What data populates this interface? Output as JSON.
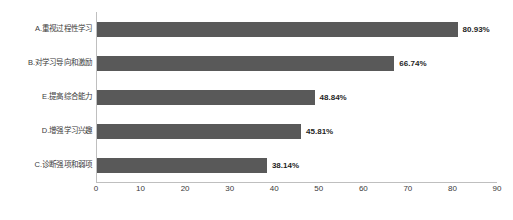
{
  "chart_data": {
    "type": "bar",
    "orientation": "horizontal",
    "title": "",
    "xlabel": "",
    "ylabel": "",
    "xlim": [
      0,
      90
    ],
    "grid": false,
    "legend": null,
    "categories": [
      "A.重视过程性学习",
      "B.对学习导向和激励",
      "E.提高综合能力",
      "D.增强学习兴趣",
      "C.诊断强项和弱项"
    ],
    "values": [
      80.93,
      66.74,
      48.84,
      45.81,
      38.14
    ],
    "value_labels": [
      "80.93%",
      "66.74%",
      "48.84%",
      "45.81%",
      "38.14%"
    ],
    "xticks": [
      "0",
      "10",
      "20",
      "30",
      "40",
      "50",
      "60",
      "70",
      "80",
      "90"
    ],
    "xtick_values": [
      0,
      10,
      20,
      30,
      40,
      50,
      60,
      70,
      80,
      90
    ],
    "bar_color": "#595959",
    "axis_color": "#bfbfbf",
    "label_color": "#3a3a3a"
  },
  "caption": {
    "text": ""
  }
}
